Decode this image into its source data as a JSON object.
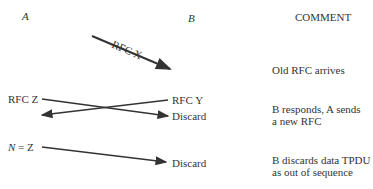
{
  "headers": {
    "a": "A",
    "b": "B",
    "comment": "COMMENT"
  },
  "messages": [
    {
      "label": "RFC X",
      "from": "A",
      "to": "B"
    },
    {
      "left_label": "RFC Z",
      "right_label": "RFC Y"
    },
    {
      "right_label": "Discard"
    },
    {
      "left_label_var": "N",
      "left_label_rest": " = Z",
      "right_label": "Discard"
    }
  ],
  "comments": [
    "Old RFC arrives",
    "B responds, A sends",
    "a new RFC",
    "B discards data TPDU",
    "as out of sequence"
  ],
  "caption": "Figure caption (cropped)"
}
